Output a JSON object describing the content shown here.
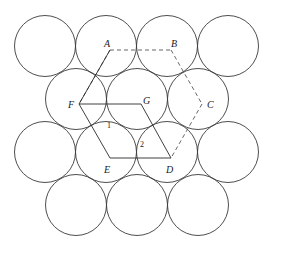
{
  "figure": {
    "background_color": "#ffffff",
    "circle_stroke_color": "#3a3a3a",
    "line_stroke_color": "#2b2b2b",
    "dashed_stroke_color": "#555555",
    "canvas": {
      "width": 286,
      "height": 266
    },
    "circle_radius": 30.5
  },
  "circles": {
    "rows": [
      {
        "name": "row-1",
        "cy": 46,
        "cxs": [
          45,
          106,
          167,
          228
        ]
      },
      {
        "name": "row-2",
        "cy": 99,
        "cxs": [
          76,
          137,
          198
        ]
      },
      {
        "name": "row-3",
        "cy": 152,
        "cxs": [
          45,
          106,
          167,
          228
        ]
      },
      {
        "name": "row-4",
        "cy": 205,
        "cxs": [
          76,
          137,
          198
        ]
      }
    ]
  },
  "vertices": {
    "A": {
      "x": 110,
      "y": 50
    },
    "B": {
      "x": 171,
      "y": 50
    },
    "C": {
      "x": 202,
      "y": 104
    },
    "D": {
      "x": 171,
      "y": 158
    },
    "E": {
      "x": 110,
      "y": 158
    },
    "F": {
      "x": 79,
      "y": 104
    },
    "G": {
      "x": 141,
      "y": 104
    }
  },
  "labels": {
    "points": [
      {
        "id": "A",
        "text": "A",
        "x": 104,
        "y": 39
      },
      {
        "id": "B",
        "text": "B",
        "x": 171,
        "y": 39
      },
      {
        "id": "C",
        "text": "C",
        "x": 207,
        "y": 100
      },
      {
        "id": "D",
        "text": "D",
        "x": 166,
        "y": 165
      },
      {
        "id": "E",
        "text": "E",
        "x": 104,
        "y": 165
      },
      {
        "id": "F",
        "text": "F",
        "x": 68,
        "y": 100
      },
      {
        "id": "G",
        "text": "G",
        "x": 143,
        "y": 96
      }
    ],
    "interstices": [
      {
        "id": "1",
        "text": "1",
        "x": 107,
        "y": 122
      },
      {
        "id": "2",
        "text": "2",
        "x": 140,
        "y": 141
      }
    ]
  },
  "edges": {
    "solid": [
      {
        "name": "edge-F-G",
        "from": "F",
        "to": "G"
      },
      {
        "name": "edge-F-A",
        "from": "F",
        "to": "A"
      },
      {
        "name": "edge-F-E",
        "from": "F",
        "to": "E"
      },
      {
        "name": "edge-E-D",
        "from": "E",
        "to": "D"
      },
      {
        "name": "edge-G-D",
        "from": "G",
        "to": "D"
      }
    ],
    "dashed": [
      {
        "name": "edge-A-B",
        "from": "A",
        "to": "B"
      },
      {
        "name": "edge-B-C",
        "from": "B",
        "to": "C"
      },
      {
        "name": "edge-C-D",
        "from": "C",
        "to": "D"
      },
      {
        "name": "edge-A-F-dashed",
        "from": "A",
        "to": "F"
      }
    ]
  }
}
